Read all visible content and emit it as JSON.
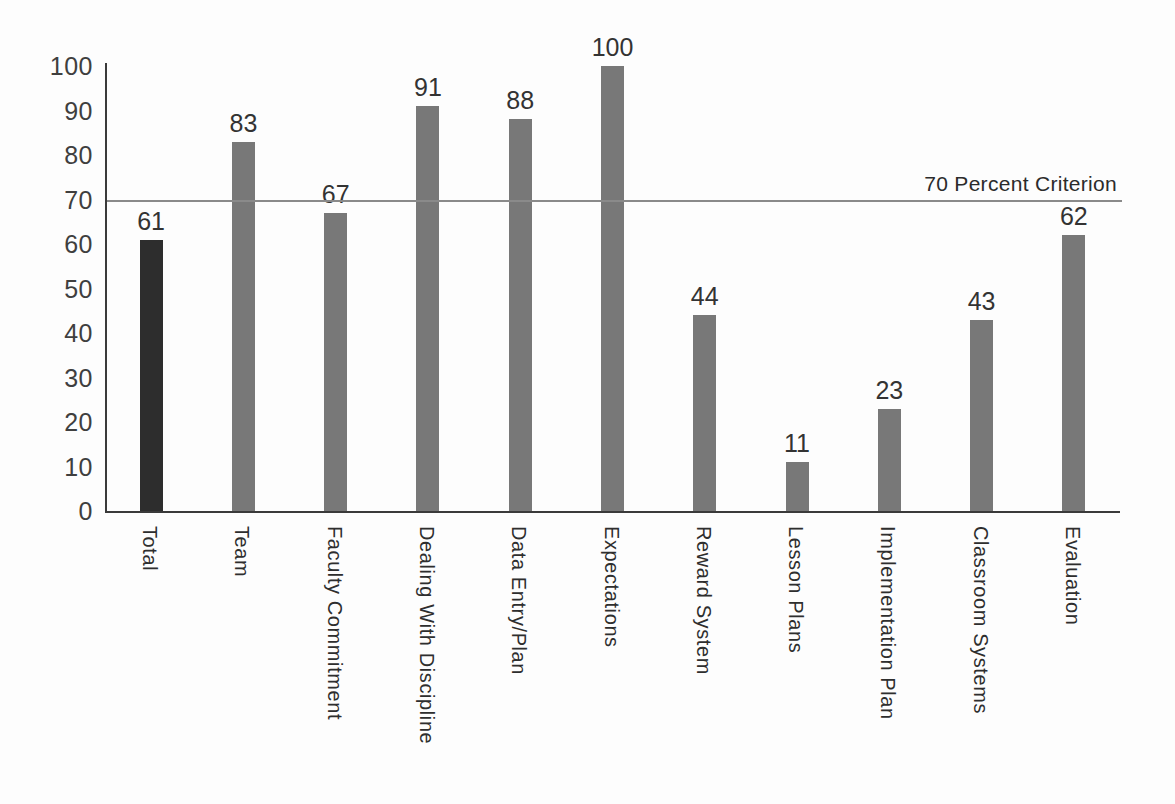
{
  "chart_data": {
    "type": "bar",
    "title": "",
    "xlabel": "",
    "ylabel": "",
    "categories": [
      "Total",
      "Team",
      "Faculty Commitment",
      "Dealing With Discipline",
      "Data Entry/Plan",
      "Expectations",
      "Reward System",
      "Lesson Plans",
      "Implementation Plan",
      "Classroom Systems",
      "Evaluation"
    ],
    "values": [
      61,
      83,
      67,
      91,
      88,
      100,
      44,
      11,
      23,
      43,
      62
    ],
    "show_value_labels": true,
    "ylim": [
      0,
      100
    ],
    "yticks": [
      0,
      10,
      20,
      30,
      40,
      50,
      60,
      70,
      80,
      90,
      100
    ],
    "grid": false,
    "legend": "none",
    "reference_line": {
      "value": 70,
      "label": "70 Percent Criterion"
    },
    "highlight_index": 0,
    "colors": {
      "bar_default": "#787878",
      "bar_highlight": "#2d2d2d",
      "axis": "#3a3a3a",
      "reference_line": "#8a8a8a",
      "value_text": "#333333",
      "tick_text": "#3f3f3f",
      "category_text": "#2e2e2e",
      "background": "#fdfdfd"
    }
  }
}
